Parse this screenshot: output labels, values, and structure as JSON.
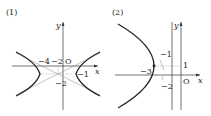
{
  "panels": [
    {
      "label": "(1)",
      "type": "hyperbola",
      "axis_x": "x",
      "axis_y": "y",
      "origin": "O",
      "ticks": [
        "-4",
        "-2",
        "-1",
        "-2"
      ],
      "tick_labels": {
        "x_neg4": "−4",
        "x_neg2": "−2",
        "y_neg1": "−1",
        "y_neg2": "−2"
      }
    },
    {
      "label": "(2)",
      "type": "parabola",
      "axis_x": "x",
      "axis_y": "y",
      "origin": "O",
      "tick_labels": {
        "x_neg3": "−3",
        "x_neg1": "−1",
        "x_neg2": "−2",
        "y_1": "1"
      }
    }
  ],
  "colors": {
    "curve": "#222222",
    "axis": "#333333",
    "guide": "#888888"
  }
}
